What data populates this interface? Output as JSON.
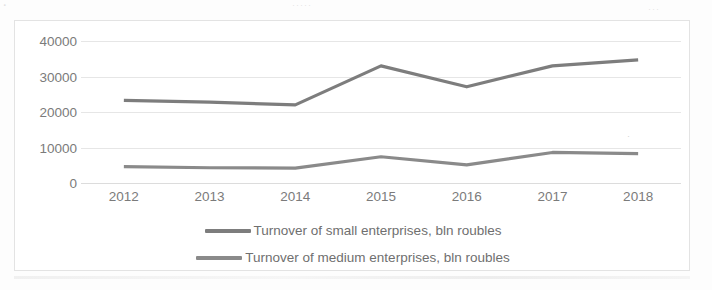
{
  "chart_data": {
    "type": "line",
    "title": "",
    "xlabel": "",
    "ylabel": "",
    "categories": [
      "2012",
      "2013",
      "2014",
      "2015",
      "2016",
      "2017",
      "2018"
    ],
    "series": [
      {
        "name": "Turnover of small enterprises, bln roubles",
        "color": "#7d7d7d",
        "values": [
          23300,
          22800,
          22000,
          33000,
          27100,
          33000,
          34700
        ]
      },
      {
        "name": "Turnover of medium enterprises, bln roubles",
        "color": "#8a8a8a",
        "values": [
          4600,
          4300,
          4200,
          7400,
          5100,
          8600,
          8300
        ]
      }
    ],
    "ylim": [
      0,
      40000
    ],
    "yticks": [
      "0",
      "10000",
      "20000",
      "30000",
      "40000"
    ],
    "ytick_values": [
      0,
      10000,
      20000,
      30000,
      40000
    ],
    "grid": true,
    "legend_position": "bottom"
  },
  "legend": {
    "entries": [
      {
        "label": "Turnover of small enterprises, bln roubles"
      },
      {
        "label": "Turnover of medium enterprises, bln roubles"
      }
    ]
  },
  "artifacts": {
    "top_fragment_left": ".",
    "top_fragment_center": "·····",
    "top_fragment_right": "···",
    "stray_mark": "·"
  },
  "colors": {
    "series_small": "#7d7d7d",
    "series_medium": "#8a8a8a",
    "gridline": "#e6e6e6",
    "axis_text": "#7b7b7b",
    "frame_border": "#e3e3e3",
    "background": "#ffffff"
  }
}
